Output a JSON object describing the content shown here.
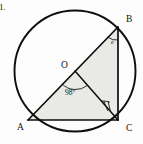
{
  "figure": {
    "item_number": "1.",
    "kind": "circle-geometry-diagram",
    "background_color": "#fdfdfd",
    "ink_color": "#0d0d0d",
    "shade_color": "#e9e9e6"
  },
  "circle": {
    "name": "circumcircle",
    "center_label": "O",
    "cx": 75,
    "cy": 71,
    "r": 60.5,
    "stroke_width": 1.9
  },
  "points": {
    "A": {
      "label": "A",
      "x": 28,
      "y": 120,
      "label_x": 17,
      "label_y": 130
    },
    "B": {
      "label": "B",
      "x": 118,
      "y": 27,
      "label_x": 126,
      "label_y": 22
    },
    "C": {
      "label": "C",
      "x": 118,
      "y": 120,
      "label_x": 126,
      "label_y": 131
    },
    "O": {
      "label": "O",
      "x": 75,
      "y": 71,
      "label_x": 61,
      "label_y": 68
    }
  },
  "segments": [
    {
      "name": "chord-AB-diameter",
      "from": "A",
      "to": "B"
    },
    {
      "name": "chord-AC",
      "from": "A",
      "to": "C"
    },
    {
      "name": "chord-BC",
      "from": "B",
      "to": "C"
    },
    {
      "name": "radius-OC",
      "from": "O",
      "to": "C"
    }
  ],
  "angles": {
    "center_angle": {
      "name": "angle-AOC",
      "value": "98°",
      "vertex": "O",
      "text_x": 65,
      "text_y": 95
    },
    "inscribed_angle": {
      "name": "angle-at-B",
      "value": "e",
      "vertex": "B",
      "text_x": 111,
      "text_y": 44
    },
    "marked_angle_at_C": {
      "name": "angle-mark-at-C",
      "vertex": "C",
      "tick_count": 2
    }
  },
  "shaded_regions": [
    {
      "name": "triangle-OBC-shaded",
      "vertices": [
        "O",
        "B",
        "C"
      ]
    },
    {
      "name": "triangle-AOC-shaded",
      "vertices": [
        "A",
        "O",
        "C"
      ]
    }
  ]
}
